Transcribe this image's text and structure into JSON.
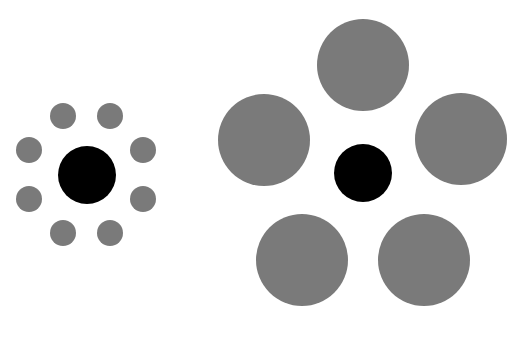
{
  "colors": {
    "background": "#ffffff",
    "center": "#000000",
    "surround": "#7a7a7a"
  },
  "left_group": {
    "center": {
      "cx": 87,
      "cy": 175,
      "r": 29
    },
    "surround": [
      {
        "cx": 63,
        "cy": 116,
        "r": 13
      },
      {
        "cx": 110,
        "cy": 116,
        "r": 13
      },
      {
        "cx": 29,
        "cy": 150,
        "r": 13
      },
      {
        "cx": 143,
        "cy": 150,
        "r": 13
      },
      {
        "cx": 29,
        "cy": 199,
        "r": 13
      },
      {
        "cx": 143,
        "cy": 199,
        "r": 13
      },
      {
        "cx": 63,
        "cy": 233,
        "r": 13
      },
      {
        "cx": 110,
        "cy": 233,
        "r": 13
      }
    ]
  },
  "right_group": {
    "center": {
      "cx": 363,
      "cy": 173,
      "r": 29
    },
    "surround": [
      {
        "cx": 363,
        "cy": 65,
        "r": 46
      },
      {
        "cx": 264,
        "cy": 140,
        "r": 46
      },
      {
        "cx": 461,
        "cy": 139,
        "r": 46
      },
      {
        "cx": 302,
        "cy": 260,
        "r": 46
      },
      {
        "cx": 424,
        "cy": 260,
        "r": 46
      }
    ]
  }
}
